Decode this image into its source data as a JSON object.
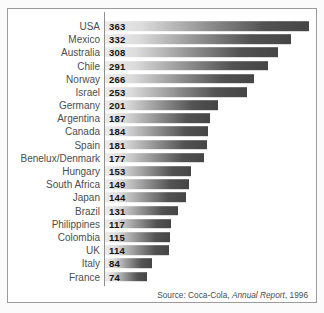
{
  "chart": {
    "source": {
      "prefix": "Source: Coca-Cola, ",
      "italic": "Annual Report",
      "suffix": ", 1996"
    }
  },
  "chart_data": {
    "type": "bar",
    "orientation": "horizontal",
    "categories": [
      "USA",
      "Mexico",
      "Australia",
      "Chile",
      "Norway",
      "Israel",
      "Germany",
      "Argentina",
      "Canada",
      "Spain",
      "Benelux/Denmark",
      "Hungary",
      "South Africa",
      "Japan",
      "Brazil",
      "Philippines",
      "Colombia",
      "UK",
      "Italy",
      "France"
    ],
    "values": [
      363,
      332,
      308,
      291,
      266,
      253,
      201,
      187,
      184,
      181,
      177,
      153,
      149,
      144,
      131,
      117,
      115,
      114,
      84,
      74
    ],
    "value_labels_shown": true,
    "xlim": [
      0,
      363
    ],
    "grid": false,
    "legend": false,
    "bar_gradient": [
      "#ededed",
      "#454545"
    ],
    "axis_color": "#8f8f8f",
    "label_color": "#4d4d4d",
    "value_label_color": "#141414",
    "source_note": "Source: Coca-Cola, Annual Report, 1996"
  }
}
